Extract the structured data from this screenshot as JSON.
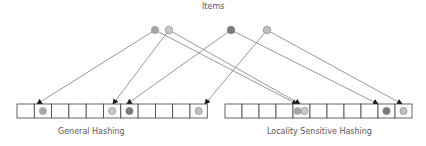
{
  "title": "Items",
  "colors": {
    "line": "#7f7f7f",
    "arrow": "#1a1a1a",
    "cell_border": "#404040",
    "item_mid": "#a6a6a6",
    "item_light": "#bfbfbf",
    "item_dark": "#7a7a7a",
    "item_light_outline": "#8c8c8c"
  },
  "items": [
    {
      "id": "a",
      "x": 155,
      "y": 30,
      "fill": "#a6a6a6",
      "stroke": "#a6a6a6"
    },
    {
      "id": "b",
      "x": 169,
      "y": 30,
      "fill": "#c8c8c8",
      "stroke": "#8c8c8c"
    },
    {
      "id": "c",
      "x": 231,
      "y": 30,
      "fill": "#7a7a7a",
      "stroke": "#7a7a7a"
    },
    {
      "id": "d",
      "x": 267,
      "y": 30,
      "fill": "#bfbfbf",
      "stroke": "#8c8c8c"
    }
  ],
  "general_hashing": {
    "label": "General Hashing",
    "x": 17,
    "y": 104,
    "cell_w": 17.3,
    "cell_h": 14,
    "cells": 11,
    "placements": [
      {
        "cell": 1,
        "item": "a"
      },
      {
        "cell": 5,
        "item": "b"
      },
      {
        "cell": 6,
        "item": "c"
      },
      {
        "cell": 10,
        "item": "d"
      }
    ]
  },
  "lsh": {
    "label": "Locality Sensitive Hashing",
    "x": 225,
    "y": 104,
    "cell_w": 17,
    "cell_h": 14,
    "cells": 11,
    "placements": [
      {
        "cell": 4,
        "item": "a",
        "offset": -4
      },
      {
        "cell": 4,
        "item": "b",
        "offset": 3
      },
      {
        "cell": 9,
        "item": "c"
      },
      {
        "cell": 10,
        "item": "d"
      }
    ]
  },
  "arrows": [
    {
      "from": "a",
      "to_x": 37,
      "to_y": 104
    },
    {
      "from": "b",
      "to_x": 113,
      "to_y": 104
    },
    {
      "from": "c",
      "to_x": 127,
      "to_y": 104
    },
    {
      "from": "d",
      "to_x": 205,
      "to_y": 104
    },
    {
      "from": "a",
      "to_x": 297,
      "to_y": 104
    },
    {
      "from": "b",
      "to_x": 300,
      "to_y": 104
    },
    {
      "from": "c",
      "to_x": 378,
      "to_y": 104
    },
    {
      "from": "d",
      "to_x": 402,
      "to_y": 104
    }
  ]
}
